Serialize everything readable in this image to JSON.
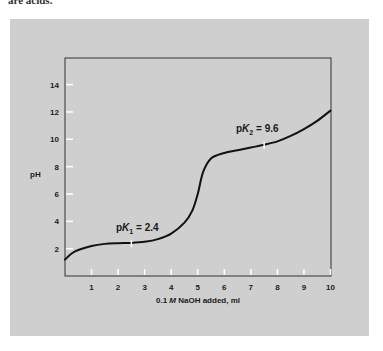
{
  "page": {
    "top_text": "are acids."
  },
  "chart_data": {
    "type": "line",
    "title": "",
    "xlabel": "0.1 M NaOH added, ml",
    "xlabel_parts": {
      "conc": "0.1",
      "unit": "M",
      "rest": "NaOH added, ml"
    },
    "ylabel": "pH",
    "xlim": [
      0,
      10
    ],
    "ylim": [
      0,
      16
    ],
    "x_ticks": [
      1,
      2,
      3,
      4,
      5,
      6,
      7,
      8,
      9,
      10
    ],
    "y_ticks": [
      2,
      4,
      6,
      8,
      10,
      12,
      14
    ],
    "grid": false,
    "legend": null,
    "series": [
      {
        "name": "Titration curve",
        "x": [
          0,
          0.25,
          0.5,
          1,
          1.5,
          2,
          2.5,
          3,
          3.5,
          4,
          4.5,
          4.8,
          5,
          5.2,
          5.5,
          6,
          6.5,
          7,
          7.5,
          8,
          8.5,
          9,
          9.5,
          10
        ],
        "y": [
          1.2,
          1.65,
          1.9,
          2.2,
          2.35,
          2.4,
          2.42,
          2.5,
          2.7,
          3.1,
          3.9,
          4.8,
          6.0,
          7.6,
          8.6,
          9.0,
          9.2,
          9.4,
          9.6,
          9.85,
          10.25,
          10.75,
          11.35,
          12.1
        ]
      }
    ],
    "annotations": [
      {
        "label": "pK",
        "sub": "1",
        "value": "= 2.4",
        "x": 2.5,
        "y": 2.4
      },
      {
        "label": "pK",
        "sub": "2",
        "value": "= 9.6",
        "x": 7.5,
        "y": 9.6
      }
    ],
    "colors": {
      "panel": "#cfcfcf",
      "line": "#111111",
      "tick": "#ffffff",
      "frame": "#333333"
    }
  }
}
